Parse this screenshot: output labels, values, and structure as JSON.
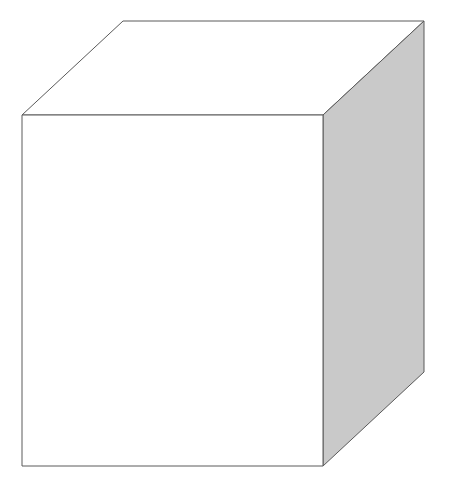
{
  "diagram": {
    "type": "3d-cuboid",
    "caption_cropped": true,
    "caption": "",
    "colors": {
      "background": "#ffffff",
      "front_face": "#ffffff",
      "top_face": "#ffffff",
      "side_face": "#c9c9c9",
      "edge": "#5a5a5a"
    },
    "vertices": {
      "front_top_left": [
        22,
        115
      ],
      "front_top_right": [
        323,
        115
      ],
      "front_bottom_left": [
        22,
        466
      ],
      "front_bottom_right": [
        323,
        466
      ],
      "back_top_left": [
        123,
        21
      ],
      "back_top_right": [
        424,
        21
      ],
      "back_bottom_right": [
        424,
        372
      ]
    }
  }
}
